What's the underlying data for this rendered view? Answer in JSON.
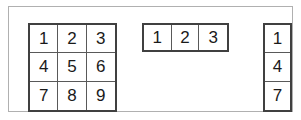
{
  "figure": {
    "background_color": "#ffffff",
    "frame_color": "#b0b0b0",
    "cell_border_color": "#404040",
    "cell_divider_color": "#595959",
    "digit_color": "#1a1a1a"
  },
  "matrix_3x3": {
    "label": "3x3 matrix",
    "rows": 3,
    "cols": 3,
    "cells": [
      [
        "1",
        "2",
        "3"
      ],
      [
        "4",
        "5",
        "6"
      ],
      [
        "7",
        "8",
        "9"
      ]
    ]
  },
  "row_vector": {
    "label": "1x3 row vector",
    "rows": 1,
    "cols": 3,
    "cells": [
      [
        "1",
        "2",
        "3"
      ]
    ]
  },
  "column_vector": {
    "label": "3x1 column vector",
    "rows": 3,
    "cols": 1,
    "cells": [
      [
        "1"
      ],
      [
        "4"
      ],
      [
        "7"
      ]
    ]
  }
}
